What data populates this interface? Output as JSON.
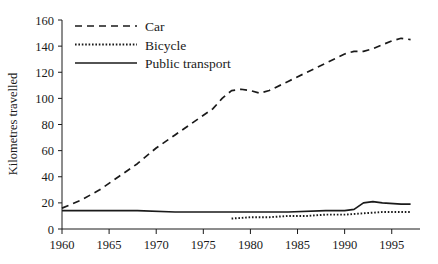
{
  "chart_data": {
    "type": "line",
    "title": "",
    "xlabel": "",
    "ylabel": "Kilometres travelled",
    "xlim": [
      1960,
      1998
    ],
    "ylim": [
      0,
      160
    ],
    "grid": false,
    "legend_position": "top-left",
    "xticks": [
      1960,
      1965,
      1970,
      1975,
      1980,
      1985,
      1990,
      1995
    ],
    "yticks": [
      0,
      20,
      40,
      60,
      80,
      100,
      120,
      140,
      160
    ],
    "series": [
      {
        "name": "Car",
        "style": "dashed",
        "color": "#1a1a1a",
        "x": [
          1960,
          1962,
          1964,
          1966,
          1968,
          1970,
          1972,
          1974,
          1976,
          1977,
          1978,
          1979,
          1980,
          1981,
          1982,
          1984,
          1986,
          1988,
          1990,
          1991,
          1992,
          1993,
          1994,
          1995,
          1996,
          1997
        ],
        "values": [
          16,
          22,
          30,
          40,
          50,
          62,
          72,
          82,
          92,
          100,
          106,
          107,
          106,
          104,
          106,
          113,
          120,
          127,
          134,
          136,
          136,
          138,
          141,
          144,
          146,
          145
        ]
      },
      {
        "name": "Bicycle",
        "style": "dotted",
        "color": "#1a1a1a",
        "x": [
          1978,
          1980,
          1982,
          1984,
          1986,
          1988,
          1990,
          1992,
          1994,
          1996,
          1997
        ],
        "values": [
          8,
          9,
          9,
          10,
          10,
          11,
          11,
          12,
          13,
          13,
          13
        ]
      },
      {
        "name": "Public transport",
        "style": "solid",
        "color": "#1a1a1a",
        "x": [
          1960,
          1964,
          1968,
          1972,
          1976,
          1980,
          1984,
          1988,
          1990,
          1991,
          1992,
          1993,
          1994,
          1996,
          1997
        ],
        "values": [
          14,
          14,
          14,
          13,
          13,
          13,
          13,
          14,
          14,
          15,
          20,
          21,
          20,
          19,
          19
        ]
      }
    ]
  },
  "legend": {
    "entries": [
      {
        "label": "Car",
        "style": "dashed"
      },
      {
        "label": "Bicycle",
        "style": "dotted"
      },
      {
        "label": "Public transport",
        "style": "solid"
      }
    ]
  },
  "axes": {
    "y_title": "Kilometres travelled",
    "y_tick_labels": [
      "160",
      "140",
      "120",
      "100",
      "80",
      "60",
      "40",
      "20",
      "0"
    ],
    "x_tick_labels": [
      "1960",
      "1965",
      "1970",
      "1975",
      "1980",
      "1985",
      "1990",
      "1995"
    ]
  }
}
